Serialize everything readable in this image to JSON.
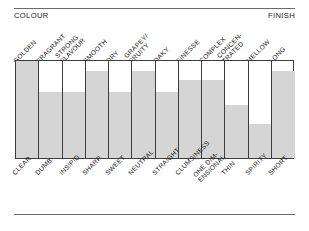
{
  "header": {
    "left_label": "COLOUR",
    "right_label": "FINISH"
  },
  "chart_data": {
    "type": "bar",
    "title": "",
    "subtitle": "",
    "xlabel": "",
    "ylabel": "",
    "ylim": [
      0,
      100
    ],
    "grid": false,
    "legend": "none",
    "orientation": "vertical",
    "axis_header_left": "COLOUR",
    "axis_header_right": "FINISH",
    "top_tick_labels": [
      "GOLDEN",
      "FRAGRANT",
      "STRONG FLAVOUR",
      "SMOOTH",
      "DRY",
      "GRAPEY/ FRUITY",
      "OAKY",
      "FINESSE",
      "COMPLEX",
      "CONCEN- TRATED",
      "MELLOW",
      "LONG"
    ],
    "bottom_tick_labels": [
      "CLEAR",
      "DUMB",
      "INSIPID",
      "SHARP",
      "SWEET",
      "NEUTRAL",
      "STRAIGHT",
      "CLUMSINESS",
      "ONE DIM- ENSIONAL",
      "THIN",
      "SPIRITY",
      "SHORT"
    ],
    "categories": [
      "GOLDEN / CLEAR",
      "FRAGRANT / DUMB",
      "STRONG FLAVOUR / INSIPID",
      "SMOOTH / SHARP",
      "DRY / SWEET",
      "GRAPEY-FRUITY / NEUTRAL",
      "OAKY / STRAIGHT",
      "FINESSE / CLUMSINESS",
      "COMPLEX / ONE DIMENSIONAL",
      "CONCENTRATED / THIN",
      "MELLOW / SPIRITY",
      "LONG / SHORT"
    ],
    "values": [
      100,
      68,
      68,
      90,
      68,
      90,
      68,
      80,
      80,
      55,
      35,
      90
    ],
    "bar_color": "#d5d5d5",
    "frame_color": "#3d3d3d"
  },
  "bars": [
    {
      "top_label_line1": "GOLDEN",
      "top_label_line2": "",
      "bottom_label_line1": "CLEAR",
      "bottom_label_line2": "",
      "value": 100
    },
    {
      "top_label_line1": "FRAGRANT",
      "top_label_line2": "",
      "bottom_label_line1": "DUMB",
      "bottom_label_line2": "",
      "value": 68
    },
    {
      "top_label_line1": "STRONG",
      "top_label_line2": "FLAVOUR",
      "bottom_label_line1": "INSIPID",
      "bottom_label_line2": "",
      "value": 68
    },
    {
      "top_label_line1": "SMOOTH",
      "top_label_line2": "",
      "bottom_label_line1": "SHARP",
      "bottom_label_line2": "",
      "value": 90
    },
    {
      "top_label_line1": "DRY",
      "top_label_line2": "",
      "bottom_label_line1": "SWEET",
      "bottom_label_line2": "",
      "value": 68
    },
    {
      "top_label_line1": "GRAPEY/",
      "top_label_line2": "FRUITY",
      "bottom_label_line1": "NEUTRAL",
      "bottom_label_line2": "",
      "value": 90
    },
    {
      "top_label_line1": "OAKY",
      "top_label_line2": "",
      "bottom_label_line1": "STRAIGHT",
      "bottom_label_line2": "",
      "value": 68
    },
    {
      "top_label_line1": "FINESSE",
      "top_label_line2": "",
      "bottom_label_line1": "CLUMSINESS",
      "bottom_label_line2": "",
      "value": 80
    },
    {
      "top_label_line1": "COMPLEX",
      "top_label_line2": "",
      "bottom_label_line1": "ONE DIM-",
      "bottom_label_line2": "ENSIONAL",
      "value": 80
    },
    {
      "top_label_line1": "CONCEN-",
      "top_label_line2": "TRATED",
      "bottom_label_line1": "THIN",
      "bottom_label_line2": "",
      "value": 55
    },
    {
      "top_label_line1": "MELLOW",
      "top_label_line2": "",
      "bottom_label_line1": "SPIRITY",
      "bottom_label_line2": "",
      "value": 35
    },
    {
      "top_label_line1": "LONG",
      "top_label_line2": "",
      "bottom_label_line1": "SHORT",
      "bottom_label_line2": "",
      "value": 90
    }
  ]
}
